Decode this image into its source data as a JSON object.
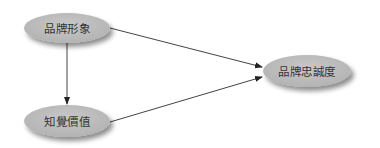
{
  "diagram": {
    "nodes": [
      {
        "id": "brand_image",
        "label": "品牌形象"
      },
      {
        "id": "perceived_value",
        "label": "知覺價值"
      },
      {
        "id": "brand_loyalty",
        "label": "品牌忠誠度"
      }
    ],
    "edges": [
      {
        "from": "brand_image",
        "to": "brand_loyalty"
      },
      {
        "from": "brand_image",
        "to": "perceived_value"
      },
      {
        "from": "perceived_value",
        "to": "brand_loyalty"
      }
    ],
    "colors": {
      "node_fill": "#bdbdbd",
      "edge": "#333333",
      "text": "#333333"
    }
  }
}
